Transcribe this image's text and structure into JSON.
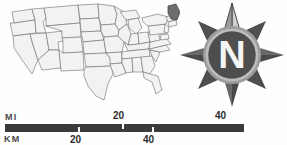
{
  "map": {
    "name": "united-states-map",
    "title": "United States",
    "highlighted_state": "Maine",
    "state_fill": "#f2f2f2",
    "state_border": "#6b6b6b",
    "highlight_fill": "#6e6e6e",
    "highlight_border": "#3a3a3a"
  },
  "compass": {
    "name": "compass-rose",
    "north_label": "N",
    "star_fill": "#5a5a5a",
    "star_highlight": "#c9c9c9",
    "disc_fill": "#555555",
    "disc_ring": "#9a9a9a",
    "letter_color": "#f5f5f5"
  },
  "scale": {
    "bar_color": "#3b3b3b",
    "miles": {
      "unit_label": "MI",
      "ticks": [
        "20",
        "40"
      ]
    },
    "kilometers": {
      "unit_label": "KM",
      "ticks": [
        "20",
        "40"
      ]
    }
  }
}
